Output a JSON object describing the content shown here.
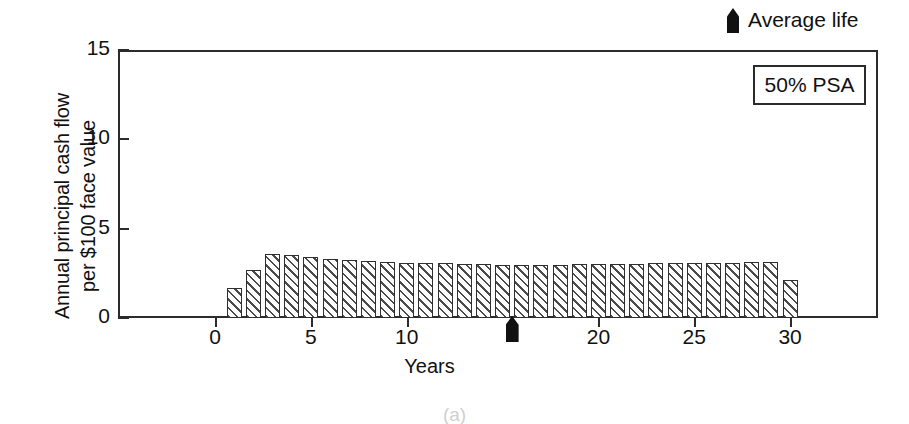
{
  "figure": {
    "caption": "(a)"
  },
  "legend": {
    "average_life_label": "Average life",
    "average_life_marker_icon": "up-arrow-marker-icon",
    "psa_label": "50% PSA"
  },
  "axes": {
    "y_title": "Annual principal cash flow\nper $100 face value",
    "x_title": "Years",
    "y_ticks": [
      {
        "value": 0,
        "label": "0"
      },
      {
        "value": 5,
        "label": "5"
      },
      {
        "value": 10,
        "label": "10"
      },
      {
        "value": 15,
        "label": "15"
      }
    ],
    "x_ticks": [
      {
        "value": 0,
        "label": "0"
      },
      {
        "value": 5,
        "label": "5"
      },
      {
        "value": 10,
        "label": "10"
      },
      {
        "value": 20,
        "label": "20"
      },
      {
        "value": 25,
        "label": "25"
      },
      {
        "value": 30,
        "label": "30"
      }
    ]
  },
  "chart_data": {
    "type": "bar",
    "title": "",
    "subtitle": "",
    "xlabel": "Years",
    "ylabel": "Annual principal cash flow per $100 face value",
    "xlim": [
      -2.5,
      36
    ],
    "ylim": [
      0,
      15
    ],
    "grid": false,
    "legend_position": "top-right",
    "annotations": [
      {
        "text": "50% PSA",
        "type": "boxed-label",
        "position": "inside-top-right"
      },
      {
        "text": "Average life",
        "type": "marker-legend",
        "position": "above-plot-right"
      },
      {
        "text": "",
        "type": "average-life-marker",
        "x": 15.5
      }
    ],
    "series": [
      {
        "name": "Annual principal cash flow",
        "fill": "diagonal-hatch",
        "x": [
          1,
          2,
          3,
          4,
          5,
          6,
          7,
          8,
          9,
          10,
          11,
          12,
          13,
          14,
          15,
          16,
          17,
          18,
          19,
          20,
          21,
          22,
          23,
          24,
          25,
          26,
          27,
          28,
          29,
          30
        ],
        "values": [
          1.7,
          2.7,
          3.6,
          3.5,
          3.4,
          3.3,
          3.25,
          3.2,
          3.15,
          3.1,
          3.1,
          3.05,
          3.0,
          3.0,
          2.95,
          2.95,
          2.95,
          2.95,
          3.0,
          3.0,
          3.0,
          3.0,
          3.05,
          3.05,
          3.05,
          3.1,
          3.1,
          3.15,
          3.15,
          2.1
        ]
      }
    ],
    "average_life_x": 15.5
  },
  "colors": {
    "axis": "#2b2b2b",
    "bar_outline": "#2f2f2f",
    "bar_hatch": "#4a4a4a",
    "marker": "#111111",
    "background": "#ffffff"
  }
}
